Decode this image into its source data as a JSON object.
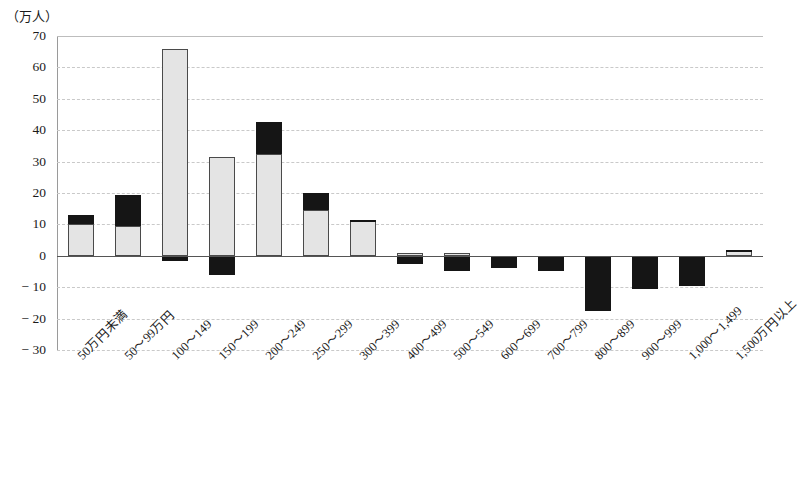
{
  "chart_data": {
    "type": "bar",
    "stacked": true,
    "title": "",
    "subtitle": "",
    "xlabel": "",
    "ylabel": "（万人）",
    "ylim": [
      -30,
      70
    ],
    "ytick_labels": [
      "70",
      "60",
      "50",
      "40",
      "30",
      "20",
      "10",
      "0",
      "− 10",
      "− 20",
      "− 30"
    ],
    "ytick_values": [
      70,
      60,
      50,
      40,
      30,
      20,
      10,
      0,
      -10,
      -20,
      -30
    ],
    "grid": true,
    "grid_axis": "y",
    "legend": [],
    "legend_position": "none",
    "categories": [
      "50万円未満",
      "50〜99万円",
      "100〜149",
      "150〜199",
      "200〜249",
      "250〜299",
      "300〜399",
      "400〜499",
      "500〜549",
      "600〜699",
      "700〜799",
      "800〜899",
      "900〜999",
      "1,000〜1,499",
      "1,500万円以上"
    ],
    "series": [
      {
        "name": "gray-segment",
        "color": "#e4e4e4",
        "values": [
          10.0,
          9.5,
          66.0,
          31.5,
          32.5,
          14.5,
          11.0,
          0.8,
          1.0,
          0.0,
          0.0,
          0.0,
          0.0,
          0.0,
          1.4
        ]
      },
      {
        "name": "black-segment",
        "color": "#151515",
        "values": [
          3.0,
          10.0,
          -1.5,
          -6.0,
          10.0,
          5.5,
          0.4,
          -2.5,
          -5.0,
          -4.0,
          -5.0,
          -17.5,
          -10.5,
          -9.5,
          0.4
        ]
      }
    ],
    "totals": [
      13.0,
      19.5,
      66.0,
      31.5,
      42.5,
      20.0,
      11.4,
      0.8,
      1.0,
      -4.0,
      -5.0,
      -17.5,
      -10.5,
      -9.5,
      1.8
    ]
  }
}
